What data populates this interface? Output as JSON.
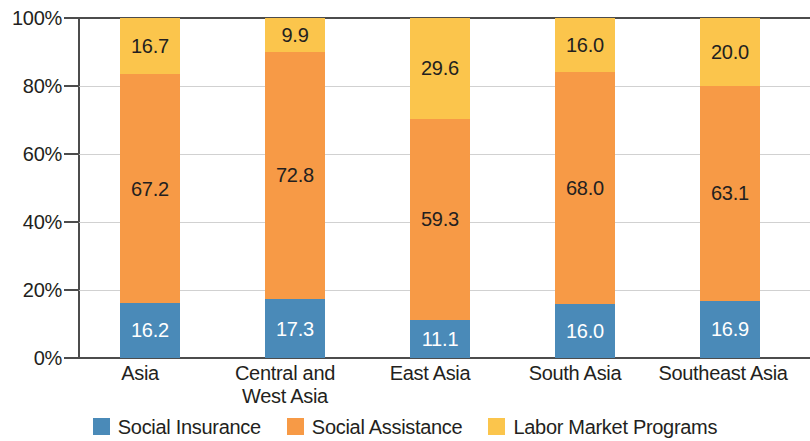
{
  "chart_data": {
    "type": "bar",
    "stacked": true,
    "normalized": true,
    "title": "",
    "subtitle": "",
    "xlabel": "",
    "ylabel": "",
    "categories": [
      "Asia",
      "Central and West Asia",
      "East Asia",
      "South Asia",
      "Southeast Asia"
    ],
    "category_lines": [
      [
        "Asia"
      ],
      [
        "Central and",
        "West Asia"
      ],
      [
        "East Asia"
      ],
      [
        "South Asia"
      ],
      [
        "Southeast Asia"
      ]
    ],
    "series": [
      {
        "name": "Social Insurance",
        "color": "#4a8ab8",
        "label_color": "#ffffff",
        "values": [
          16.2,
          17.3,
          11.1,
          16.0,
          16.9
        ],
        "value_labels": [
          "16.2",
          "17.3",
          "11.1",
          "16.0",
          "16.9"
        ]
      },
      {
        "name": "Social Assistance",
        "color": "#f79a46",
        "label_color": "#231f20",
        "values": [
          67.2,
          72.8,
          59.3,
          68.0,
          63.1
        ],
        "value_labels": [
          "67.2",
          "72.8",
          "59.3",
          "68.0",
          "63.1"
        ]
      },
      {
        "name": "Labor Market Programs",
        "color": "#fbc54c",
        "label_color": "#231f20",
        "values": [
          16.7,
          9.9,
          29.6,
          16.0,
          20.0
        ],
        "value_labels": [
          "16.7",
          "9.9",
          "29.6",
          "16.0",
          "20.0"
        ]
      }
    ],
    "ylim": [
      0,
      100
    ],
    "y_ticks": [
      0,
      20,
      40,
      60,
      80,
      100
    ],
    "y_tick_labels": [
      "0%",
      "20%",
      "40%",
      "60%",
      "80%",
      "100%"
    ],
    "grid": true,
    "grid_axis": "y",
    "legend_position": "bottom",
    "legend_entries": [
      "Social Insurance",
      "Social Assistance",
      "Labor Market Programs"
    ]
  },
  "axis": {
    "y_tick_labels": [
      "100%",
      "80%",
      "60%",
      "40%",
      "20%",
      "0%"
    ]
  },
  "legend": {
    "items": [
      {
        "label": "Social Insurance",
        "color": "#4a8ab8"
      },
      {
        "label": "Social Assistance",
        "color": "#f79a46"
      },
      {
        "label": "Labor Market Programs",
        "color": "#fbc54c"
      }
    ]
  }
}
